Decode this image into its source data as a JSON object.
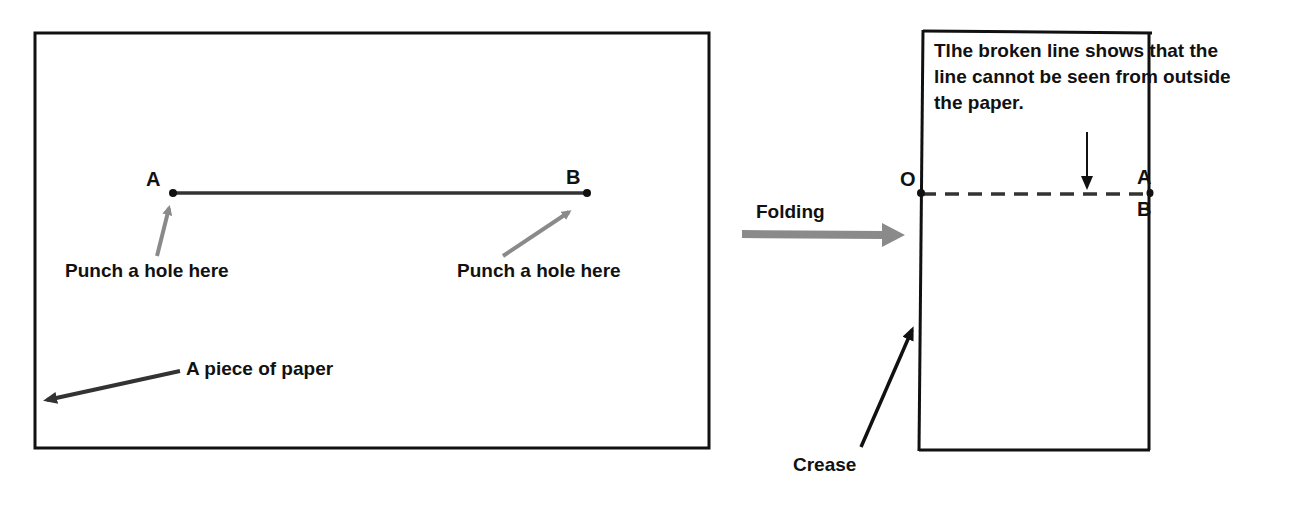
{
  "diagram": {
    "left_panel": {
      "point_a": "A",
      "point_b": "B",
      "hole_label_left": "Punch a hole here",
      "hole_label_right": "Punch a hole here",
      "paper_label": "A piece of paper"
    },
    "fold_arrow": {
      "label": "Folding",
      "color": "#888888"
    },
    "right_panel": {
      "point_o": "O",
      "point_a": "A",
      "point_b": "B",
      "note": "Tlhe broken line shows that the line cannot be seen from outside the paper.",
      "crease_label": "Crease"
    },
    "colors": {
      "line": "#111111",
      "gray_arrow": "#8a8a8a",
      "dark_arrow": "#333333"
    }
  }
}
